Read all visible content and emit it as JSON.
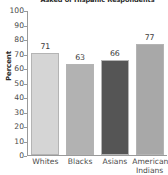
{
  "chart_data": {
    "type": "bar",
    "title": "Asked of Hispanic Respondents",
    "xlabel": "",
    "ylabel": "Percent",
    "ylim": [
      0,
      100
    ],
    "ytick_step": 10,
    "yticks": [
      "100",
      "90",
      "80",
      "70",
      "60",
      "50",
      "40",
      "30",
      "20",
      "10",
      "0"
    ],
    "grid": false,
    "legend": false,
    "categories": [
      "Whites",
      "Blacks",
      "Asians",
      "American Indians"
    ],
    "values": [
      71,
      63,
      66,
      77
    ],
    "value_labels": [
      "71",
      "63",
      "66",
      "77"
    ],
    "bar_colors": [
      "#d5d5d5",
      "#b2b2b2",
      "#555555",
      "#a8a8a8"
    ],
    "bar_edge_color": "#b4b4b4",
    "axis_color": "#9a9a9a",
    "text_color": "#4a4a4a",
    "title_color": "#2b2b2b",
    "background": "#ffffff",
    "category_lines": [
      [
        "Whites"
      ],
      [
        "Blacks"
      ],
      [
        "Asians"
      ],
      [
        "American",
        "Indians"
      ]
    ]
  }
}
